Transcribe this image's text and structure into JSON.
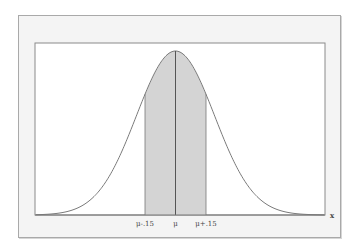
{
  "chart_data": {
    "type": "area",
    "title": "",
    "xlabel": "x",
    "ylabel": "",
    "x_ticks": [
      "μ-.15",
      "μ",
      "μ+.15"
    ],
    "shaded_interval": [
      "μ-.15",
      "μ+.15"
    ],
    "center_line": "μ",
    "grid": false,
    "legend": null,
    "distribution": {
      "name": "normal",
      "sigma_relative_to_interval": 1.3
    },
    "colors": {
      "curve": "#7a7a7a",
      "shade": "#d4d4d4",
      "center_line": "#555555",
      "plot_bg": "#ffffff",
      "frame_bg": "#f4f4f4",
      "axis": "#888888"
    }
  },
  "labels": {
    "left_tick": "μ-.15",
    "center_tick": "μ",
    "right_tick": "μ+.15",
    "x_axis": "x"
  }
}
